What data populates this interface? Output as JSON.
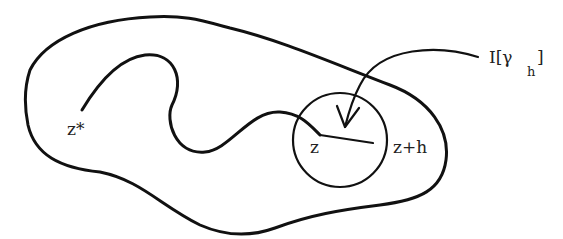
{
  "diagram": {
    "type": "complex-analysis-sketch",
    "colors": {
      "stroke": "#111111",
      "text": "#222222",
      "background": "#ffffff"
    },
    "labels": {
      "start_point": "z*",
      "center_point": "z",
      "end_point": "z+h",
      "integral_main": "I[γ",
      "integral_sub": "h",
      "integral_close": "]"
    },
    "elements": {
      "outer_region": "closed blob boundary",
      "path": "curve from z* to z",
      "disc": "circle centered near z",
      "segment": "line from z to z+h",
      "arrow": "curved arrow from I[γ_h] pointing into disc"
    }
  }
}
